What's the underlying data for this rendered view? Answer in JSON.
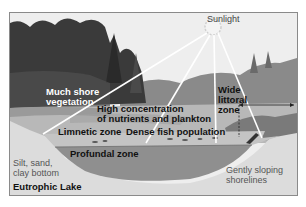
{
  "diagram": {
    "title": "Eutrophic Lake",
    "labels": {
      "sunlight": "Sunlight",
      "shore_vegetation": [
        "Much shore",
        "vegetation"
      ],
      "nutrients": [
        "High concentration",
        "of nutrients and plankton"
      ],
      "limnetic": "Limnetic zone",
      "fish": "Dense fish population",
      "profundal": "Profundal zone",
      "littoral": [
        "Wide",
        "littoral",
        "zone"
      ],
      "bottom": [
        "Silt, sand,",
        "clay bottom"
      ],
      "shorelines": [
        "Gently sloping",
        "shorelines"
      ]
    },
    "colors": {
      "sky": "#eeeeee",
      "trees_dark": "#3a3a3a",
      "trees_far": "#7a7a7a",
      "water_surface": "#b8b8b8",
      "limnetic_band": "#c4c4c4",
      "profundal": "#8f8f8f",
      "sediment": "#dcdcdc",
      "frame": "#8a8a8a"
    }
  }
}
